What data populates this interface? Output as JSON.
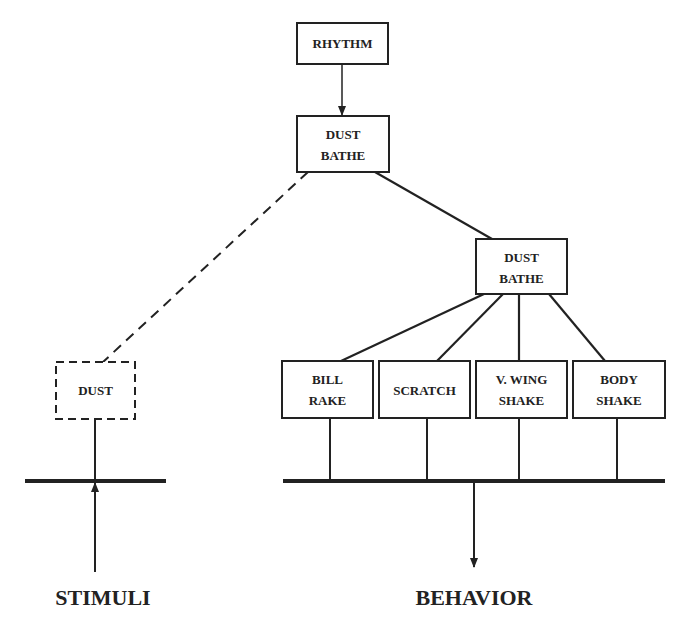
{
  "diagram": {
    "nodes": {
      "rhythm": {
        "lines": [
          "RHYTHM"
        ]
      },
      "dust_bathe_top": {
        "lines": [
          "DUST",
          "BATHE"
        ]
      },
      "dust_bathe_mid": {
        "lines": [
          "DUST",
          "BATHE"
        ]
      },
      "dust": {
        "lines": [
          "DUST"
        ],
        "style": "dashed"
      },
      "bill_rake": {
        "lines": [
          "BILL",
          "RAKE"
        ]
      },
      "scratch": {
        "lines": [
          "SCRATCH"
        ]
      },
      "v_wing_shake": {
        "lines": [
          "V. WING",
          "SHAKE"
        ]
      },
      "body_shake": {
        "lines": [
          "BODY",
          "SHAKE"
        ]
      }
    },
    "edges": [
      {
        "from": "rhythm",
        "to": "dust_bathe_top",
        "style": "arrow"
      },
      {
        "from": "dust_bathe_top",
        "to": "dust",
        "style": "dashed"
      },
      {
        "from": "dust_bathe_top",
        "to": "dust_bathe_mid",
        "style": "solid"
      },
      {
        "from": "dust_bathe_mid",
        "to": "bill_rake",
        "style": "solid"
      },
      {
        "from": "dust_bathe_mid",
        "to": "scratch",
        "style": "solid"
      },
      {
        "from": "dust_bathe_mid",
        "to": "v_wing_shake",
        "style": "solid"
      },
      {
        "from": "dust_bathe_mid",
        "to": "body_shake",
        "style": "solid"
      }
    ],
    "labels": {
      "stimuli": "STIMULI",
      "behavior": "BEHAVIOR"
    },
    "colors": {
      "stroke": "#222222",
      "background": "#ffffff"
    }
  }
}
